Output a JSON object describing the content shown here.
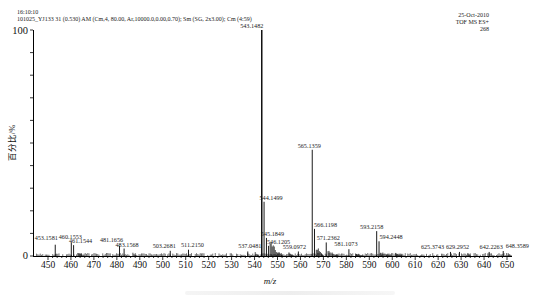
{
  "header": {
    "time": "16:10:10",
    "acquisition": "101025_YJ133 31 (0.530) AM (Cm,4, 80.00, Ar,10000.0,0.00,0.70); Sm (SG, 2x3.00); Cm (4:59)",
    "date": "25-Oct-2010",
    "instrument": "TOF MS ES+",
    "count": "268"
  },
  "chart_data": {
    "type": "bar",
    "subtype": "mass-spectrum-stick-plot",
    "title": "",
    "xlabel": "m/z",
    "ylabel": "百分比/%",
    "xlim": [
      446,
      653
    ],
    "ylim": [
      0,
      100
    ],
    "grid": false,
    "x_ticks": [
      450,
      460,
      470,
      480,
      490,
      500,
      510,
      520,
      530,
      540,
      550,
      560,
      570,
      580,
      590,
      600,
      610,
      620,
      630,
      640,
      650
    ],
    "x_minor_tick_step": 2,
    "y_tick_step_pct": 10,
    "y_axis_labels": {
      "max": "100",
      "min": "0"
    },
    "base_peak": {
      "mz": 543.1482,
      "intensity_pct": 100
    },
    "peaks": [
      {
        "mz": 453.1581,
        "intensity": 5.0,
        "label": "453.1581",
        "dx": -9,
        "dy": -3
      },
      {
        "mz": 460.1553,
        "intensity": 6.0,
        "label": "460.1553",
        "dx": -1,
        "dy": -1
      },
      {
        "mz": 461.1544,
        "intensity": 4.8,
        "label": "461.1544",
        "dx": 7,
        "dy": 0
      },
      {
        "mz": 481.1656,
        "intensity": 4.5,
        "label": "481.1656",
        "dx": -8,
        "dy": -2
      },
      {
        "mz": 483.1568,
        "intensity": 3.3,
        "label": "483.1568",
        "dx": 3,
        "dy": 0
      },
      {
        "mz": 503.2681,
        "intensity": 2.3,
        "label": "503.2681",
        "dx": -6,
        "dy": -1
      },
      {
        "mz": 511.215,
        "intensity": 2.8,
        "label": "511.2150",
        "dx": 4,
        "dy": -1
      },
      {
        "mz": 537.0481,
        "intensity": 2.0,
        "label": "537.0481",
        "dx": 2,
        "dy": -1
      },
      {
        "mz": 543.1482,
        "intensity": 100,
        "label": "543.1482",
        "dx": -10,
        "dy": 0
      },
      {
        "mz": 544.1499,
        "intensity": 24.0,
        "label": "544.1499",
        "dx": 7,
        "dy": 0
      },
      {
        "mz": 545.1849,
        "intensity": 8.0,
        "label": "545.1849",
        "dx": 6,
        "dy": 0
      },
      {
        "mz": 546.1205,
        "intensity": 4.5,
        "label": "546.1205",
        "dx": 10,
        "dy": 0
      },
      {
        "mz": 559.0972,
        "intensity": 2.0,
        "label": "559.0972",
        "dx": -4,
        "dy": 0
      },
      {
        "mz": 565.1359,
        "intensity": 47.0,
        "label": "565.1359",
        "dx": -3,
        "dy": 0
      },
      {
        "mz": 566.1198,
        "intensity": 12.0,
        "label": "566.1198",
        "dx": 11,
        "dy": 0
      },
      {
        "mz": 571.2362,
        "intensity": 6.0,
        "label": "571.2362",
        "dx": 2,
        "dy": 0
      },
      {
        "mz": 581.1073,
        "intensity": 3.0,
        "label": "581.1073",
        "dx": -3,
        "dy": -1
      },
      {
        "mz": 593.2158,
        "intensity": 11.0,
        "label": "593.2158",
        "dx": -5,
        "dy": 0
      },
      {
        "mz": 594.2448,
        "intensity": 6.5,
        "label": "594.2448",
        "dx": 12,
        "dy": 0
      },
      {
        "mz": 625.3743,
        "intensity": 1.8,
        "label": "625.3743",
        "dx": -18,
        "dy": -1
      },
      {
        "mz": 629.2952,
        "intensity": 1.8,
        "label": "629.2952",
        "dx": -2,
        "dy": -1
      },
      {
        "mz": 642.2263,
        "intensity": 1.8,
        "label": "642.2263",
        "dx": 2,
        "dy": -1
      },
      {
        "mz": 648.3589,
        "intensity": 2.2,
        "label": "648.3589",
        "dx": 14,
        "dy": -1
      }
    ],
    "noise_floor_pct": 1.0,
    "noise_clusters": [
      {
        "from": 540.3,
        "to": 542.6,
        "max": 2.2
      },
      {
        "from": 546.8,
        "to": 553.0,
        "max": 7.0
      },
      {
        "from": 555.0,
        "to": 558.2,
        "max": 1.8
      },
      {
        "from": 566.9,
        "to": 570.6,
        "max": 5.0
      },
      {
        "from": 572.0,
        "to": 578.0,
        "max": 2.8
      },
      {
        "from": 584.0,
        "to": 588.5,
        "max": 1.8
      },
      {
        "from": 595.0,
        "to": 601.0,
        "max": 2.0
      },
      {
        "from": 601.5,
        "to": 606.0,
        "max": 1.5
      },
      {
        "from": 463.0,
        "to": 466.5,
        "max": 2.0
      },
      {
        "from": 487.0,
        "to": 489.5,
        "max": 1.8
      },
      {
        "from": 633.0,
        "to": 635.0,
        "max": 1.4
      },
      {
        "from": 650.5,
        "to": 652.5,
        "max": 1.6
      }
    ]
  }
}
